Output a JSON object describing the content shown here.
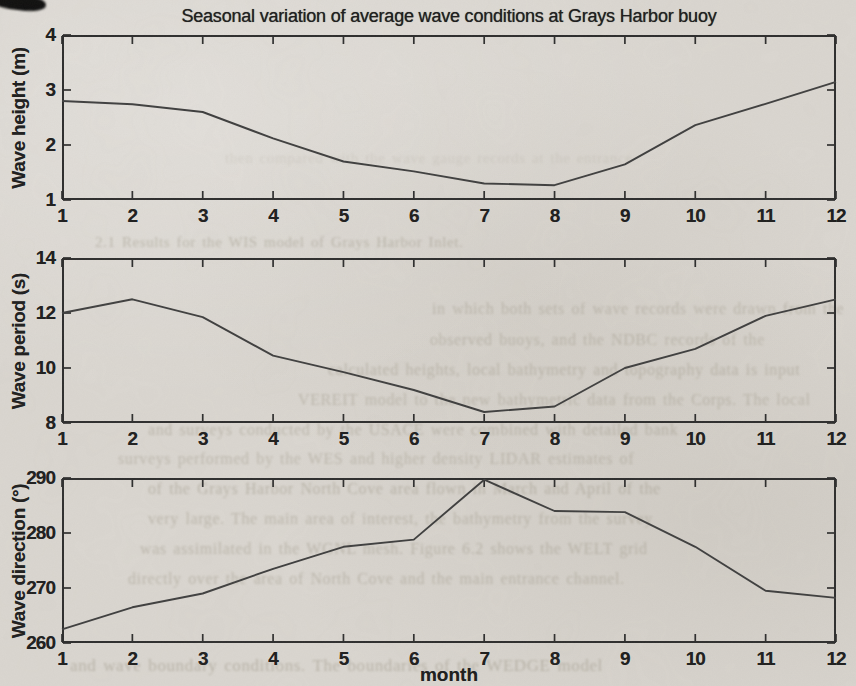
{
  "page": {
    "title": "Seasonal variation of average wave conditions at Grays Harbor buoy",
    "xlabel": "month"
  },
  "colors": {
    "paper": "#dbd7d1",
    "axis": "#2b2b2b",
    "line": "#3d3d3d",
    "text": "#1b1b1b",
    "bleed_text": "#837c68"
  },
  "chart_data": [
    {
      "type": "line",
      "title": "Seasonal variation of average wave conditions at Grays Harbor buoy",
      "ylabel": "Wave height (m)",
      "xlabel": "",
      "x": [
        1,
        2,
        3,
        4,
        5,
        6,
        7,
        8,
        9,
        10,
        11,
        12
      ],
      "values": [
        2.8,
        2.74,
        2.6,
        2.12,
        1.7,
        1.52,
        1.3,
        1.27,
        1.65,
        2.36,
        2.75,
        3.15
      ],
      "xlim": [
        1,
        12
      ],
      "ylim": [
        1,
        4
      ],
      "xticks": [
        1,
        2,
        3,
        4,
        5,
        6,
        7,
        8,
        9,
        10,
        11,
        12
      ],
      "yticks": [
        1,
        2,
        3,
        4
      ],
      "grid": false,
      "legend": null
    },
    {
      "type": "line",
      "title": "",
      "ylabel": "Wave period (s)",
      "xlabel": "",
      "x": [
        1,
        2,
        3,
        4,
        5,
        6,
        7,
        8,
        9,
        10,
        11,
        12
      ],
      "values": [
        12.0,
        12.5,
        11.85,
        10.45,
        9.85,
        9.2,
        8.4,
        8.6,
        10.0,
        10.7,
        11.9,
        12.5
      ],
      "xlim": [
        1,
        12
      ],
      "ylim": [
        8,
        14
      ],
      "xticks": [
        1,
        2,
        3,
        4,
        5,
        6,
        7,
        8,
        9,
        10,
        11,
        12
      ],
      "yticks": [
        8,
        10,
        12,
        14
      ],
      "grid": false,
      "legend": null
    },
    {
      "type": "line",
      "title": "",
      "ylabel": "Wave direction (°)",
      "xlabel": "month",
      "x": [
        1,
        2,
        3,
        4,
        5,
        6,
        7,
        8,
        9,
        10,
        11,
        12
      ],
      "values": [
        262.5,
        266.5,
        269,
        273.5,
        277.5,
        278.8,
        289.7,
        284,
        283.8,
        277.5,
        269.5,
        268.2
      ],
      "xlim": [
        1,
        12
      ],
      "ylim": [
        260,
        290
      ],
      "xticks": [
        1,
        2,
        3,
        4,
        5,
        6,
        7,
        8,
        9,
        10,
        11,
        12
      ],
      "yticks": [
        260,
        270,
        280,
        290
      ],
      "grid": false,
      "legend": null
    }
  ],
  "layout": {
    "charts": [
      {
        "left": 62,
        "top": 35,
        "width": 774,
        "height": 165
      },
      {
        "left": 62,
        "top": 258,
        "width": 774,
        "height": 165
      },
      {
        "left": 62,
        "top": 478,
        "width": 774,
        "height": 165
      }
    ]
  },
  "bleed_text": [
    {
      "text": "then compared with the wave gauge records at the entrance",
      "x": 225,
      "y": 150,
      "size": 15,
      "opacity": 0.14,
      "blur": 1.2
    },
    {
      "text": "2.1    Results for the WIS model of Grays Harbor Inlet.",
      "x": 95,
      "y": 234,
      "size": 15,
      "opacity": 0.36,
      "blur": 0.9
    },
    {
      "text": "in which both sets of wave records were drawn from the",
      "x": 432,
      "y": 300,
      "size": 16,
      "opacity": 0.32,
      "blur": 0.9
    },
    {
      "text": "observed buoys, and the NDBC records of the",
      "x": 430,
      "y": 331,
      "size": 16,
      "opacity": 0.32,
      "blur": 0.9
    },
    {
      "text": "calculated heights, local bathymetry and topography data is input",
      "x": 328,
      "y": 361,
      "size": 16,
      "opacity": 0.34,
      "blur": 0.9
    },
    {
      "text": "VEREIT model to the new bathymetric data from the Corps. The local",
      "x": 298,
      "y": 391,
      "size": 16,
      "opacity": 0.32,
      "blur": 0.9
    },
    {
      "text": "and surveys conducted by the USACE were combined with detailed bank",
      "x": 148,
      "y": 421,
      "size": 16,
      "opacity": 0.34,
      "blur": 0.9
    },
    {
      "text": "surveys performed by the WES and higher density LIDAR estimates of",
      "x": 118,
      "y": 450,
      "size": 16,
      "opacity": 0.32,
      "blur": 0.9
    },
    {
      "text": "of the Grays Harbor North Cove area flown in March and April of the",
      "x": 148,
      "y": 480,
      "size": 16,
      "opacity": 0.36,
      "blur": 0.9
    },
    {
      "text": "very large. The main area of interest, the bathymetry from the survey",
      "x": 148,
      "y": 510,
      "size": 16,
      "opacity": 0.34,
      "blur": 0.9
    },
    {
      "text": "was assimilated in the WGNL mesh. Figure 6.2 shows the WELT grid",
      "x": 140,
      "y": 540,
      "size": 16,
      "opacity": 0.34,
      "blur": 0.9
    },
    {
      "text": "directly over the area of North Cove and the main entrance channel.",
      "x": 128,
      "y": 570,
      "size": 16,
      "opacity": 0.34,
      "blur": 0.9
    },
    {
      "text": "and wave boundary conditions.   The boundaries of the WEDGE model",
      "x": 70,
      "y": 656,
      "size": 17,
      "opacity": 0.38,
      "blur": 0.8
    }
  ]
}
